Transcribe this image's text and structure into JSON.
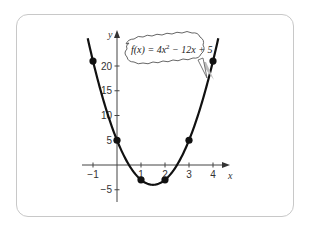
{
  "chart_data": {
    "type": "line",
    "title": "",
    "annotation": "f(x) = 4x^2 - 12x + 5",
    "equation": {
      "prefix": "f(x) = 4x",
      "exponent": "2",
      "suffix": " − 12x + 5"
    },
    "xlabel": "x",
    "ylabel": "y",
    "xlim": [
      -1.3,
      4.7
    ],
    "ylim": [
      -7,
      27
    ],
    "x_ticks": [
      -1,
      1,
      2,
      3,
      4
    ],
    "x_tick_labels": [
      "−1",
      "1",
      "2",
      "3",
      "4"
    ],
    "y_ticks": [
      20,
      15,
      10,
      5,
      -5
    ],
    "y_tick_labels": [
      "20",
      "15",
      "10",
      "5",
      "−5"
    ],
    "grid": false,
    "legend": null,
    "series": [
      {
        "name": "f(x) = 4x^2 - 12x + 5",
        "function": "4x^2 - 12x + 5",
        "color": "#111111",
        "points": [
          {
            "x": -1,
            "y": 21
          },
          {
            "x": 0,
            "y": 5
          },
          {
            "x": 1,
            "y": -3
          },
          {
            "x": 2,
            "y": -3
          },
          {
            "x": 3,
            "y": 5
          },
          {
            "x": 4,
            "y": 21
          }
        ],
        "vertex": {
          "x": 1.5,
          "y": -4
        }
      }
    ]
  },
  "colors": {
    "card_border": "#c8c8c8",
    "curve": "#111111",
    "axis": "#444444",
    "callout_fill": "#ffffff",
    "callout_shadow": "#bdbdbd"
  }
}
